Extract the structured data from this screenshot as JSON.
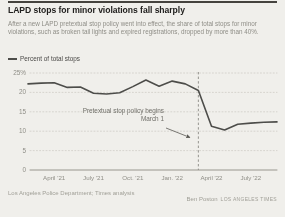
{
  "header": {
    "title": "LAPD stops for minor violations fall sharply",
    "subtitle": "After a new LAPD pretextual stop policy went into effect, the share of total stops for minor violations, such as broken tail lights and expired registrations, dropped by more than 40%."
  },
  "legend": {
    "label": "Percent of total stops"
  },
  "annotation": {
    "line1": "Pretextual stop policy begins",
    "line2": "March 1"
  },
  "footer": {
    "source": "Los Angeles Police Department; Times analysis",
    "credit_name": "Ben Poston",
    "credit_org": "LOS ANGELES TIMES"
  },
  "colors": {
    "line": "#4d4d4a",
    "grid": "#cfcdc6",
    "zero_axis": "#98968e",
    "event_line": "#8a8984",
    "arrow": "#5a5954",
    "background": "#f0efeb"
  },
  "chart_data": {
    "type": "line",
    "title": "LAPD stops for minor violations fall sharply",
    "series_name": "Percent of total stops",
    "xlabel": "",
    "ylabel": "Percent of total stops",
    "ylim": [
      0,
      25
    ],
    "grid": true,
    "legend_position": "top-left",
    "x": [
      "Feb. '21",
      "March '21",
      "April '21",
      "May '21",
      "June '21",
      "July '21",
      "Aug. '21",
      "Sep. '21",
      "Oct. '21",
      "Nov. '21",
      "Dec. '21",
      "Jan. '22",
      "Feb. '22",
      "March '22",
      "April '22",
      "May '22",
      "June '22",
      "July '22",
      "Aug. '22",
      "Sep. '22"
    ],
    "values": [
      22.2,
      22.4,
      22.5,
      21.3,
      21.4,
      19.8,
      19.6,
      19.9,
      21.5,
      23.2,
      21.6,
      22.9,
      22.2,
      20.5,
      11.3,
      10.3,
      11.8,
      12.1,
      12.3,
      12.4
    ],
    "yticks": [
      {
        "label": "25%",
        "value": 25
      },
      {
        "label": "20",
        "value": 20
      },
      {
        "label": "15",
        "value": 15
      },
      {
        "label": "10",
        "value": 10
      },
      {
        "label": "5",
        "value": 5
      },
      {
        "label": "0",
        "value": 0
      }
    ],
    "xticks": [
      {
        "label": "April '21",
        "month_index": 2
      },
      {
        "label": "July '21",
        "month_index": 5
      },
      {
        "label": "Oct. '21",
        "month_index": 8
      },
      {
        "label": "Jan. '22",
        "month_index": 11
      },
      {
        "label": "April '22",
        "month_index": 14
      },
      {
        "label": "July '22",
        "month_index": 17
      }
    ],
    "event_line": {
      "month_index": 13,
      "style": "dashed",
      "label": "Pretextual stop policy begins March 1"
    }
  }
}
